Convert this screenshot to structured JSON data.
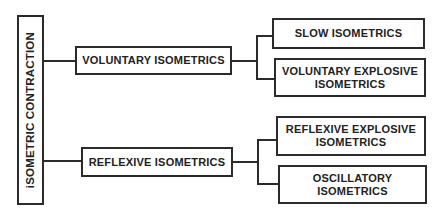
{
  "diagram": {
    "root": {
      "label": "iSOMETRIC CONTRACTION"
    },
    "branches": [
      {
        "label": "VOLUNTARY ISOMETRICS",
        "children": [
          {
            "line1": "SLOW ISOMETRICS",
            "line2": ""
          },
          {
            "line1": "VOLUNTARY EXPLOSIVE",
            "line2": "ISOMETRICS"
          }
        ]
      },
      {
        "label": "REFLEXIVE ISOMETRICS",
        "children": [
          {
            "line1": "REFLEXIVE EXPLOSIVE",
            "line2": "ISOMETRICS"
          },
          {
            "line1": "OSCILLATORY",
            "line2": "ISOMETRICS"
          }
        ]
      }
    ],
    "colors": {
      "line": "#2b2b2b",
      "text": "#222222",
      "background": "#ffffff"
    }
  }
}
